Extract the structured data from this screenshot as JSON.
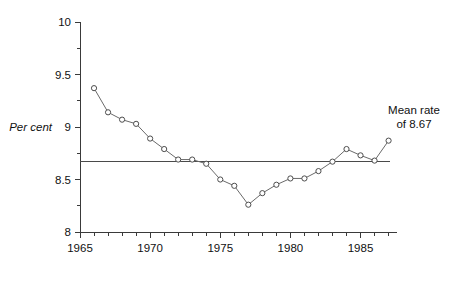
{
  "chart_data": {
    "type": "line",
    "title": "",
    "subtitle": "",
    "xlabel": "",
    "ylabel": "Per cent",
    "xlim": [
      1965,
      1987.6
    ],
    "ylim": [
      8,
      10
    ],
    "grid": false,
    "legend_position": "none",
    "x": [
      1966,
      1967,
      1968,
      1969,
      1970,
      1971,
      1972,
      1973,
      1974,
      1975,
      1976,
      1977,
      1978,
      1979,
      1980,
      1981,
      1982,
      1983,
      1984,
      1985,
      1986,
      1987
    ],
    "values": [
      9.37,
      9.14,
      9.07,
      9.03,
      8.89,
      8.79,
      8.69,
      8.69,
      8.65,
      8.5,
      8.44,
      8.26,
      8.37,
      8.45,
      8.51,
      8.51,
      8.58,
      8.67,
      8.79,
      8.73,
      8.68,
      8.87
    ],
    "series": [
      {
        "name": "rate",
        "values": [
          9.37,
          9.14,
          9.07,
          9.03,
          8.89,
          8.79,
          8.69,
          8.69,
          8.65,
          8.5,
          8.44,
          8.26,
          8.37,
          8.45,
          8.51,
          8.51,
          8.58,
          8.67,
          8.79,
          8.73,
          8.68,
          8.87
        ]
      }
    ],
    "y_tick_labels": [
      "8",
      "8.5",
      "9",
      "9.5",
      "10"
    ],
    "y_tick_values": [
      8,
      8.5,
      9,
      9.5,
      10
    ],
    "y_minor_tick_values": [
      8.25,
      8.75,
      9.25,
      9.75
    ],
    "x_tick_values": [
      1965,
      1966,
      1967,
      1968,
      1969,
      1970,
      1971,
      1972,
      1973,
      1974,
      1975,
      1976,
      1977,
      1978,
      1979,
      1980,
      1981,
      1982,
      1983,
      1984,
      1985,
      1986,
      1987
    ],
    "x_tick_labels": [
      "1965",
      "1970",
      "1975",
      "1980",
      "1985"
    ],
    "x_labelled_tick_values": [
      1965,
      1970,
      1975,
      1980,
      1985
    ],
    "reference_line": {
      "value": 8.67,
      "label_line1": "Mean rate",
      "label_line2": "of 8.67"
    }
  },
  "annotation": {
    "line1": "Mean rate",
    "line2": "of 8.67"
  },
  "axis": {
    "y_title": "Per cent"
  },
  "colors": {
    "axis": "#3a3a3a",
    "series_line": "#6a6a6a",
    "marker_stroke": "#4d4d4d",
    "marker_fill": "#ffffff",
    "mean_line": "#4a4a4a",
    "text": "#111111",
    "background": "#ffffff"
  }
}
